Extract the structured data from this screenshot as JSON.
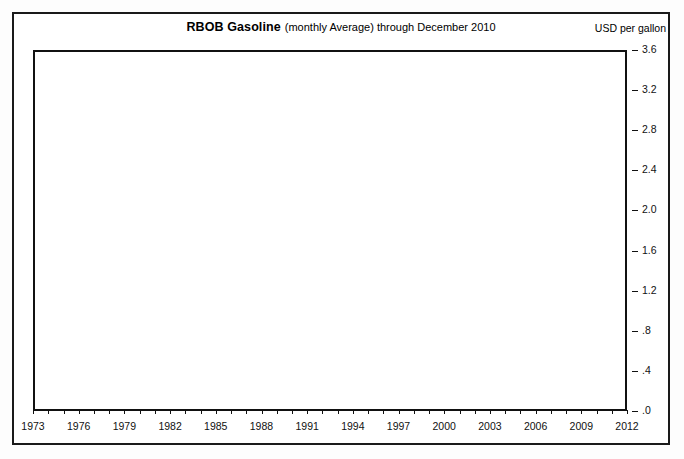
{
  "chart": {
    "title_main": "RBOB Gasoline",
    "title_sub": "(monthly Average) through December 2010",
    "units_label": "USD per gallon"
  },
  "chart_data": {
    "type": "line",
    "title": "RBOB Gasoline (monthly Average) through December 2010",
    "xlabel": "",
    "ylabel": "USD per gallon",
    "xlim": [
      1973,
      2012
    ],
    "ylim": [
      0.0,
      3.6
    ],
    "grid": true,
    "legend": "none",
    "ytick_labels": [
      "3.6",
      "3.2",
      "2.8",
      "2.4",
      "2.0",
      "1.6",
      "1.2",
      ".8",
      ".4",
      ".0"
    ],
    "ytick_values": [
      3.6,
      3.2,
      2.8,
      2.4,
      2.0,
      1.6,
      1.2,
      0.8,
      0.4,
      0.0
    ],
    "xtick_labels": [
      "1973",
      "1976",
      "1979",
      "1982",
      "1985",
      "1988",
      "1991",
      "1994",
      "1997",
      "2000",
      "2003",
      "2006",
      "2009",
      "2012"
    ],
    "xtick_values": [
      1973,
      1976,
      1979,
      1982,
      1985,
      1988,
      1991,
      1994,
      1997,
      2000,
      2003,
      2006,
      2009,
      2012
    ],
    "series": [
      {
        "name": "retail-gasoline-thin",
        "style": "thin",
        "color": "#111111",
        "x": [
          1973.9,
          1974.2,
          1974.5,
          1974.9,
          1975.3,
          1975.7,
          1976.1,
          1976.5,
          1976.9,
          1977.3,
          1977.7,
          1978.1,
          1978.5,
          1978.9,
          1979.1,
          1979.3,
          1979.5,
          1979.7,
          1979.9,
          1980.1,
          1980.4,
          1980.7,
          1981.0,
          1981.3,
          1981.6,
          1981.9,
          1982.2,
          1982.5,
          1982.8,
          1983.1,
          1983.4,
          1983.7,
          1984.0,
          1984.3,
          1984.6,
          1984.9,
          1985.2,
          1985.5,
          1985.8,
          1986.0,
          1986.2,
          1986.4,
          1986.6,
          1986.9,
          1987.2,
          1987.5,
          1987.8,
          1988.1,
          1988.4,
          1988.7,
          1989.0,
          1989.3,
          1989.6,
          1989.9,
          1990.2,
          1990.5,
          1990.7,
          1990.85,
          1991.0,
          1991.15
        ],
        "values": [
          0.4,
          0.48,
          0.54,
          0.57,
          0.58,
          0.57,
          0.6,
          0.61,
          0.6,
          0.62,
          0.63,
          0.63,
          0.65,
          0.66,
          0.74,
          0.88,
          1.02,
          1.1,
          1.14,
          1.22,
          1.25,
          1.24,
          1.3,
          1.34,
          1.32,
          1.3,
          1.28,
          1.22,
          1.15,
          1.22,
          1.2,
          1.18,
          1.16,
          1.15,
          1.13,
          1.12,
          1.14,
          1.12,
          1.1,
          1.05,
          0.9,
          0.8,
          0.78,
          0.82,
          0.86,
          0.9,
          0.88,
          0.86,
          0.84,
          0.9,
          0.95,
          1.02,
          0.98,
          1.0,
          1.02,
          1.1,
          1.24,
          1.32,
          1.18,
          1.02
        ]
      },
      {
        "name": "wholesale-gasoline-thick",
        "style": "thick",
        "color": "#0a0a0a",
        "x": [
          1976.0,
          1976.4,
          1976.8,
          1977.2,
          1977.6,
          1978.0,
          1978.3,
          1978.6,
          1978.9,
          1979.05,
          1979.15,
          1979.25,
          1979.35,
          1979.45,
          1979.55,
          1979.65,
          1979.75,
          1979.9,
          1980.1,
          1980.3,
          1980.5,
          1980.7,
          1980.9,
          1981.1,
          1981.3,
          1981.5,
          1981.7,
          1981.9,
          1982.1,
          1982.3,
          1982.5,
          1982.7,
          1982.9,
          1983.1,
          1983.3,
          1983.5,
          1983.7,
          1983.9,
          1984.1,
          1984.3,
          1984.5,
          1984.7,
          1984.9,
          1985.1,
          1985.3,
          1985.5,
          1985.7,
          1985.9,
          1986.0,
          1986.1,
          1986.2,
          1986.3,
          1986.45,
          1986.6,
          1986.8,
          1987.0,
          1987.2,
          1987.4,
          1987.6,
          1987.8,
          1988.0,
          1988.2,
          1988.4,
          1988.6,
          1988.8,
          1989.0,
          1989.2,
          1989.4,
          1989.6,
          1989.8,
          1990.0,
          1990.2,
          1990.4,
          1990.6,
          1990.75,
          1990.9,
          1991.05,
          1991.2,
          1991.4,
          1991.6,
          1991.8,
          1992.0,
          1992.2,
          1992.4,
          1992.6,
          1992.8,
          1993.0,
          1993.2,
          1993.4,
          1993.6,
          1993.8,
          1994.0,
          1994.2,
          1994.4,
          1994.6,
          1994.8,
          1995.0,
          1995.2,
          1995.4,
          1995.6,
          1995.8,
          1996.0,
          1996.2,
          1996.4,
          1996.6,
          1996.8,
          1997.0,
          1997.2,
          1997.4,
          1997.6,
          1997.8,
          1998.0,
          1998.2,
          1998.4,
          1998.6,
          1998.8,
          1999.0,
          1999.1,
          1999.3,
          1999.5,
          1999.7,
          1999.9,
          2000.1,
          2000.3,
          2000.5,
          2000.7,
          2000.9,
          2001.1,
          2001.3,
          2001.5,
          2001.7,
          2001.9,
          2002.1,
          2002.3,
          2002.5,
          2002.7,
          2002.9,
          2003.1,
          2003.3,
          2003.5,
          2003.7,
          2003.9,
          2004.1,
          2004.3,
          2004.5,
          2004.7,
          2004.9,
          2005.1,
          2005.3,
          2005.5,
          2005.7,
          2005.85,
          2006.0,
          2006.2,
          2006.4,
          2006.55,
          2006.7,
          2006.9,
          2007.1,
          2007.3,
          2007.45,
          2007.6,
          2007.8,
          2008.0,
          2008.2,
          2008.35,
          2008.5,
          2008.6,
          2008.7,
          2008.8,
          2008.9,
          2009.0,
          2009.15,
          2009.3,
          2009.5,
          2009.7,
          2009.85,
          2010.0,
          2010.2,
          2010.4,
          2010.55,
          2010.7,
          2010.85,
          2011.0
        ],
        "values": [
          0.4,
          0.4,
          0.41,
          0.42,
          0.43,
          0.44,
          0.46,
          0.47,
          0.48,
          0.52,
          0.62,
          0.8,
          0.7,
          0.92,
          0.74,
          1.0,
          0.82,
          0.95,
          0.98,
          0.96,
          1.0,
          0.99,
          1.04,
          1.02,
          1.0,
          0.97,
          0.94,
          0.98,
          0.92,
          0.88,
          0.84,
          0.86,
          0.8,
          0.86,
          0.82,
          0.88,
          0.84,
          0.8,
          0.82,
          0.78,
          0.8,
          0.76,
          0.78,
          0.74,
          0.78,
          0.8,
          0.76,
          0.74,
          0.7,
          0.6,
          0.45,
          0.32,
          0.4,
          0.36,
          0.44,
          0.42,
          0.48,
          0.5,
          0.46,
          0.52,
          0.48,
          0.54,
          0.5,
          0.56,
          0.52,
          0.5,
          0.62,
          0.68,
          0.58,
          0.6,
          0.56,
          0.6,
          0.64,
          0.8,
          1.02,
          0.8,
          0.72,
          0.66,
          0.62,
          0.6,
          0.58,
          0.56,
          0.6,
          0.64,
          0.6,
          0.56,
          0.54,
          0.58,
          0.56,
          0.6,
          0.52,
          0.48,
          0.52,
          0.58,
          0.56,
          0.52,
          0.56,
          0.58,
          0.54,
          0.56,
          0.52,
          0.56,
          0.64,
          0.58,
          0.62,
          0.6,
          0.64,
          0.58,
          0.56,
          0.54,
          0.52,
          0.48,
          0.44,
          0.42,
          0.4,
          0.38,
          0.35,
          0.38,
          0.46,
          0.54,
          0.58,
          0.62,
          0.68,
          0.82,
          0.88,
          0.86,
          0.92,
          0.8,
          0.94,
          0.78,
          0.66,
          0.62,
          0.58,
          0.7,
          0.76,
          0.82,
          0.8,
          0.86,
          0.8,
          0.84,
          0.88,
          0.92,
          0.98,
          1.04,
          1.12,
          1.18,
          1.1,
          1.22,
          1.3,
          1.42,
          1.86,
          1.38,
          1.48,
          1.62,
          2.08,
          1.5,
          1.7,
          1.62,
          1.58,
          1.78,
          2.26,
          1.92,
          2.12,
          2.22,
          2.4,
          2.26,
          3.45,
          2.7,
          2.0,
          1.4,
          1.02,
          0.88,
          1.28,
          1.52,
          1.7,
          1.66,
          1.76,
          1.92,
          1.84,
          2.02,
          1.96,
          2.1,
          2.22,
          2.38
        ]
      }
    ]
  }
}
